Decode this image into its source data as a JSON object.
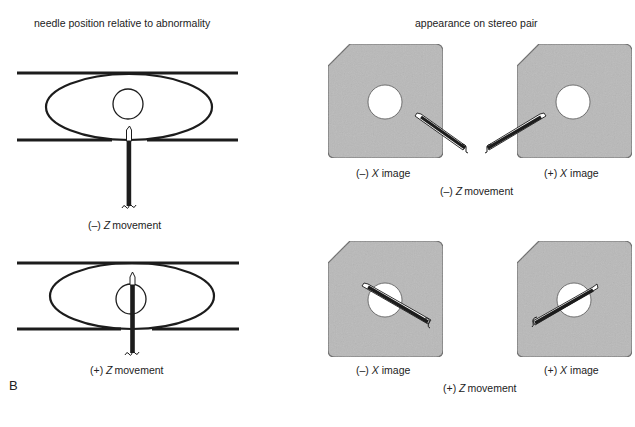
{
  "headings": {
    "left": "needle position relative to abnormality",
    "right": "appearance on stereo pair"
  },
  "panel_letter": "B",
  "rows": [
    {
      "movement_sign": "(–)",
      "movement_axis": "Z",
      "movement_word": "movement",
      "left_image": {
        "sign": "(–)",
        "axis": "X",
        "word": "image"
      },
      "right_image": {
        "sign": "(+)",
        "axis": "X",
        "word": "image"
      }
    },
    {
      "movement_sign": "(+)",
      "movement_axis": "Z",
      "movement_word": "movement",
      "left_image": {
        "sign": "(–)",
        "axis": "X",
        "word": "image"
      },
      "right_image": {
        "sign": "(+)",
        "axis": "X",
        "word": "image"
      }
    }
  ],
  "colors": {
    "ink": "#1c1c1c",
    "plate_fill": "#b9b9b9",
    "plate_stroke": "#6a6a6a",
    "lesion_fill": "#ffffff"
  }
}
